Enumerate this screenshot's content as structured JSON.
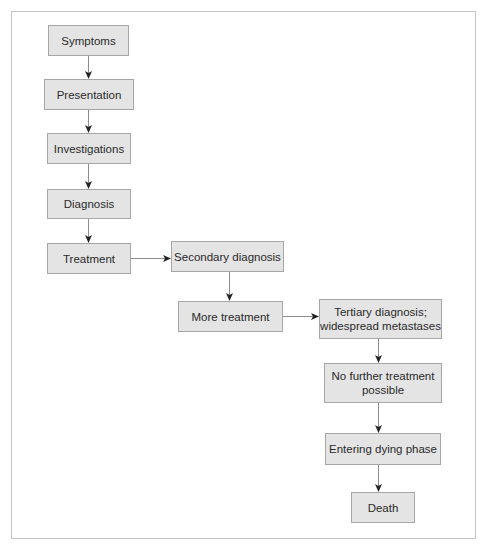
{
  "diagram": {
    "type": "flowchart",
    "colors": {
      "node_fill": "#e4e4e4",
      "node_border": "#a6a6a6",
      "edge_line": "#8c8c8c",
      "arrowhead": "#222222",
      "frame_border": "#c4c4c4",
      "text": "#2a2a2a"
    },
    "nodes": [
      {
        "id": "symptoms",
        "label": "Symptoms"
      },
      {
        "id": "presentation",
        "label": "Presentation"
      },
      {
        "id": "investigations",
        "label": "Investigations"
      },
      {
        "id": "diagnosis",
        "label": "Diagnosis"
      },
      {
        "id": "treatment",
        "label": "Treatment"
      },
      {
        "id": "secondary_diagnosis",
        "label": "Secondary diagnosis"
      },
      {
        "id": "more_treatment",
        "label": "More treatment"
      },
      {
        "id": "tertiary_diagnosis",
        "label": "Tertiary diagnosis;\nwidespread metastases"
      },
      {
        "id": "no_further_treatment",
        "label": "No further treatment\npossible"
      },
      {
        "id": "entering_dying_phase",
        "label": "Entering dying phase"
      },
      {
        "id": "death",
        "label": "Death"
      }
    ],
    "edges": [
      {
        "from": "symptoms",
        "to": "presentation"
      },
      {
        "from": "presentation",
        "to": "investigations"
      },
      {
        "from": "investigations",
        "to": "diagnosis"
      },
      {
        "from": "diagnosis",
        "to": "treatment"
      },
      {
        "from": "treatment",
        "to": "secondary_diagnosis"
      },
      {
        "from": "secondary_diagnosis",
        "to": "more_treatment"
      },
      {
        "from": "more_treatment",
        "to": "tertiary_diagnosis"
      },
      {
        "from": "tertiary_diagnosis",
        "to": "no_further_treatment"
      },
      {
        "from": "no_further_treatment",
        "to": "entering_dying_phase"
      },
      {
        "from": "entering_dying_phase",
        "to": "death"
      }
    ]
  }
}
